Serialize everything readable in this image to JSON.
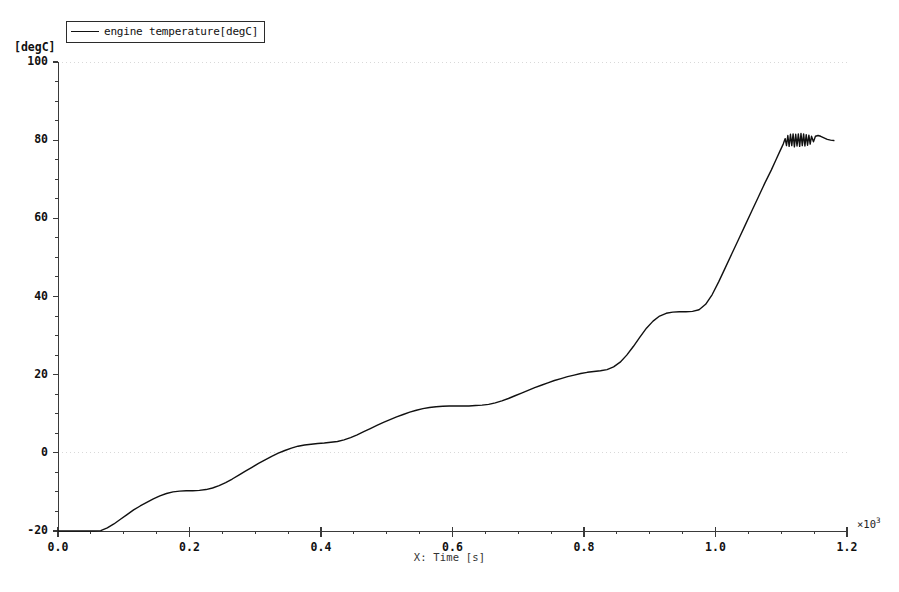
{
  "chart_data": {
    "type": "line",
    "title": "",
    "xlabel": "X: Time [s]",
    "ylabel": "[degC]",
    "x_multiplier": "×10",
    "x_multiplier_exp": "3",
    "xlim": [
      0.0,
      1.2
    ],
    "ylim": [
      -20,
      100
    ],
    "xticks": [
      "0.0",
      "0.2",
      "0.4",
      "0.6",
      "0.8",
      "1.0",
      "1.2"
    ],
    "xtick_values": [
      0.0,
      0.2,
      0.4,
      0.6,
      0.8,
      1.0,
      1.2
    ],
    "yticks": [
      "100",
      "80",
      "60",
      "40",
      "20",
      "0",
      "-20"
    ],
    "ytick_values": [
      100,
      80,
      60,
      40,
      20,
      0,
      -20
    ],
    "x_minor_tick_step": 0.05,
    "y_minor_tick_step": 5,
    "grid": "dotted-horizontal-at-0-and-100",
    "gridlines_y": [
      0,
      100
    ],
    "legend": {
      "position": "top-left-outside",
      "entries": [
        {
          "label": "engine temperature[degC]",
          "color": "#111111"
        }
      ]
    },
    "series": [
      {
        "name": "engine temperature[degC]",
        "color": "#111111",
        "line_width": 1.4,
        "x_unit_note": "x values are in units of 10^3 seconds as plotted",
        "points": [
          [
            0.0,
            -20.0
          ],
          [
            0.02,
            -20.0
          ],
          [
            0.04,
            -20.0
          ],
          [
            0.055,
            -20.0
          ],
          [
            0.065,
            -19.9
          ],
          [
            0.075,
            -19.2
          ],
          [
            0.085,
            -18.2
          ],
          [
            0.095,
            -17.0
          ],
          [
            0.105,
            -15.8
          ],
          [
            0.115,
            -14.6
          ],
          [
            0.125,
            -13.6
          ],
          [
            0.135,
            -12.7
          ],
          [
            0.145,
            -11.8
          ],
          [
            0.155,
            -11.0
          ],
          [
            0.165,
            -10.4
          ],
          [
            0.175,
            -10.0
          ],
          [
            0.185,
            -9.8
          ],
          [
            0.195,
            -9.7
          ],
          [
            0.205,
            -9.7
          ],
          [
            0.215,
            -9.6
          ],
          [
            0.225,
            -9.4
          ],
          [
            0.235,
            -9.0
          ],
          [
            0.245,
            -8.4
          ],
          [
            0.255,
            -7.6
          ],
          [
            0.265,
            -6.7
          ],
          [
            0.275,
            -5.7
          ],
          [
            0.285,
            -4.7
          ],
          [
            0.295,
            -3.7
          ],
          [
            0.305,
            -2.7
          ],
          [
            0.315,
            -1.8
          ],
          [
            0.325,
            -0.9
          ],
          [
            0.335,
            -0.1
          ],
          [
            0.345,
            0.6
          ],
          [
            0.355,
            1.2
          ],
          [
            0.365,
            1.7
          ],
          [
            0.375,
            2.0
          ],
          [
            0.385,
            2.2
          ],
          [
            0.395,
            2.4
          ],
          [
            0.405,
            2.5
          ],
          [
            0.415,
            2.7
          ],
          [
            0.425,
            2.9
          ],
          [
            0.435,
            3.3
          ],
          [
            0.445,
            3.9
          ],
          [
            0.455,
            4.6
          ],
          [
            0.465,
            5.4
          ],
          [
            0.475,
            6.2
          ],
          [
            0.485,
            7.0
          ],
          [
            0.495,
            7.8
          ],
          [
            0.505,
            8.5
          ],
          [
            0.515,
            9.2
          ],
          [
            0.525,
            9.8
          ],
          [
            0.535,
            10.4
          ],
          [
            0.545,
            10.9
          ],
          [
            0.555,
            11.3
          ],
          [
            0.565,
            11.6
          ],
          [
            0.575,
            11.8
          ],
          [
            0.585,
            11.9
          ],
          [
            0.595,
            12.0
          ],
          [
            0.605,
            12.0
          ],
          [
            0.615,
            12.0
          ],
          [
            0.625,
            12.0
          ],
          [
            0.635,
            12.1
          ],
          [
            0.645,
            12.2
          ],
          [
            0.655,
            12.4
          ],
          [
            0.665,
            12.8
          ],
          [
            0.675,
            13.3
          ],
          [
            0.685,
            13.9
          ],
          [
            0.695,
            14.6
          ],
          [
            0.705,
            15.3
          ],
          [
            0.715,
            16.0
          ],
          [
            0.725,
            16.7
          ],
          [
            0.735,
            17.3
          ],
          [
            0.745,
            17.9
          ],
          [
            0.755,
            18.5
          ],
          [
            0.765,
            19.0
          ],
          [
            0.775,
            19.5
          ],
          [
            0.785,
            19.9
          ],
          [
            0.795,
            20.3
          ],
          [
            0.805,
            20.6
          ],
          [
            0.815,
            20.8
          ],
          [
            0.825,
            21.0
          ],
          [
            0.835,
            21.3
          ],
          [
            0.845,
            22.0
          ],
          [
            0.855,
            23.2
          ],
          [
            0.865,
            25.0
          ],
          [
            0.875,
            27.2
          ],
          [
            0.885,
            29.6
          ],
          [
            0.895,
            31.9
          ],
          [
            0.905,
            33.7
          ],
          [
            0.915,
            35.0
          ],
          [
            0.925,
            35.7
          ],
          [
            0.935,
            36.0
          ],
          [
            0.945,
            36.1
          ],
          [
            0.955,
            36.1
          ],
          [
            0.965,
            36.2
          ],
          [
            0.975,
            36.6
          ],
          [
            0.985,
            38.0
          ],
          [
            0.995,
            40.5
          ],
          [
            1.005,
            43.8
          ],
          [
            1.015,
            47.4
          ],
          [
            1.025,
            51.0
          ],
          [
            1.035,
            54.6
          ],
          [
            1.045,
            58.2
          ],
          [
            1.055,
            61.8
          ],
          [
            1.065,
            65.4
          ],
          [
            1.075,
            69.0
          ],
          [
            1.085,
            72.4
          ],
          [
            1.092,
            75.0
          ],
          [
            1.098,
            77.2
          ],
          [
            1.103,
            79.0
          ],
          [
            1.106,
            80.4
          ],
          [
            1.108,
            78.6
          ],
          [
            1.11,
            81.2
          ],
          [
            1.112,
            78.4
          ],
          [
            1.114,
            81.5
          ],
          [
            1.116,
            78.6
          ],
          [
            1.118,
            81.6
          ],
          [
            1.12,
            78.3
          ],
          [
            1.122,
            81.5
          ],
          [
            1.124,
            78.5
          ],
          [
            1.126,
            81.6
          ],
          [
            1.128,
            78.4
          ],
          [
            1.13,
            81.7
          ],
          [
            1.132,
            78.6
          ],
          [
            1.134,
            81.6
          ],
          [
            1.136,
            78.5
          ],
          [
            1.138,
            81.4
          ],
          [
            1.14,
            78.7
          ],
          [
            1.142,
            81.3
          ],
          [
            1.144,
            79.0
          ],
          [
            1.146,
            81.0
          ],
          [
            1.149,
            79.6
          ],
          [
            1.152,
            81.0
          ],
          [
            1.156,
            81.2
          ],
          [
            1.16,
            81.0
          ],
          [
            1.165,
            80.6
          ],
          [
            1.17,
            80.2
          ],
          [
            1.175,
            80.0
          ],
          [
            1.18,
            79.9
          ]
        ]
      }
    ],
    "annotations": []
  },
  "axes": {
    "y_unit": "[degC]",
    "x_title": "X: Time [s]"
  },
  "colors": {
    "line": "#111111",
    "axis": "#3a3a3a",
    "grid": "#d9d9d9",
    "background": "#ffffff"
  }
}
